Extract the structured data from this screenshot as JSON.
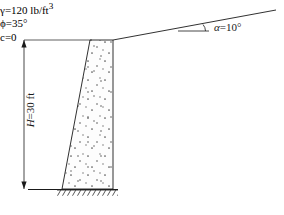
{
  "figure": {
    "type": "engineering-diagram",
    "background_color": "#ffffff",
    "line_color": "#1a1a1a",
    "fill_color": "#fdfdfd"
  },
  "annotations": {
    "backfill_slope": {
      "symbol": "α",
      "equals": "=",
      "value": "10",
      "unit": "°",
      "full_text": "α = 10°"
    },
    "wall_height": {
      "symbol": "H",
      "equals": "=",
      "value": "30",
      "unit": "ft",
      "full_text": "H = 30 ft"
    }
  },
  "soil_properties": {
    "unit_weight": {
      "symbol": "γ",
      "equals": "=",
      "value": "120",
      "unit": "lb/ft",
      "unit_exponent": "3",
      "full_text": "γ = 120 lb/ft³"
    },
    "friction_angle": {
      "symbol": "ϕ",
      "equals": "=",
      "value": "35",
      "unit": "°",
      "full_text": "ϕ = 35°"
    },
    "cohesion": {
      "symbol": "c",
      "equals": "=",
      "value": "0",
      "unit": "",
      "full_text": "c = 0"
    }
  },
  "geometry": {
    "wall_top_y": 40,
    "wall_base_y": 189,
    "wall_top_left_x": 90,
    "wall_top_right_x": 113,
    "wall_base_left_x": 62,
    "wall_base_right_x": 113,
    "ground_line_start_x": 28,
    "ground_line_end_x": 118,
    "slope_end_x": 276,
    "slope_end_y": 10,
    "angle_reference_start_x": 178,
    "angle_reference_end_x": 209,
    "angle_reference_y": 31,
    "dimension_line_x": 24
  }
}
